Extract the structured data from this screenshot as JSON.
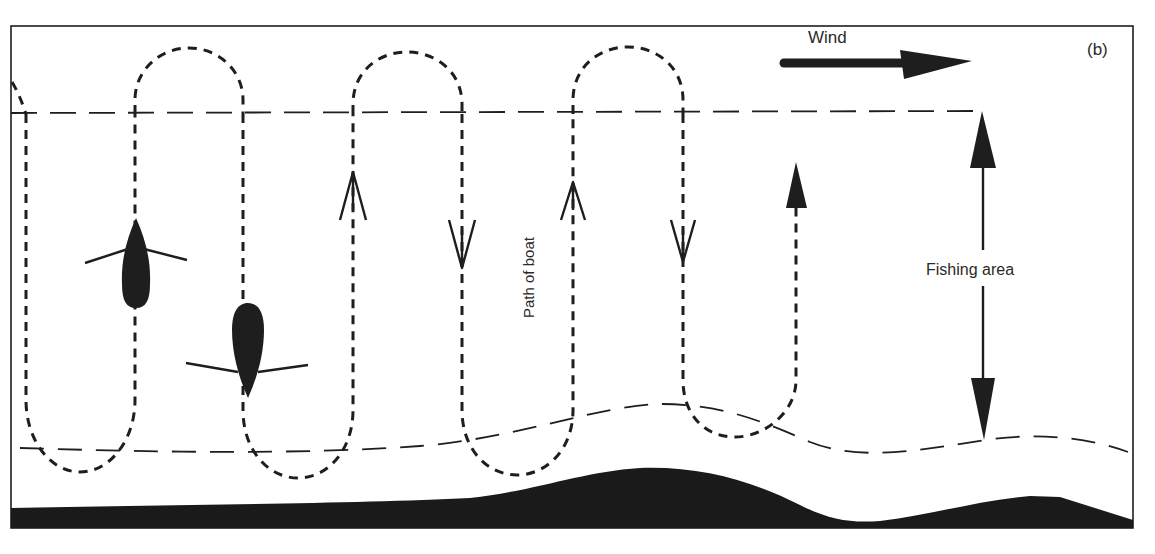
{
  "figure": {
    "panel_label": "(b)",
    "wind_label": "Wind",
    "fishing_area_label": "Fishing area",
    "path_label": "Path of boat",
    "colors": {
      "ink": "#1e1e1e",
      "background": "#ffffff",
      "seabed": "#1a1a1a"
    },
    "elements": {
      "wind_arrow": {
        "direction": "right"
      },
      "boats": [
        {
          "id": "boat-1",
          "heading": "up"
        },
        {
          "id": "boat-2",
          "heading": "down"
        }
      ],
      "path_direction_arrows": [
        "up",
        "down",
        "up",
        "down",
        "up"
      ],
      "fishing_area_arrow": "double-headed-vertical",
      "boundaries": [
        "surface-dashed-line",
        "seabed-dashed-line"
      ]
    }
  }
}
